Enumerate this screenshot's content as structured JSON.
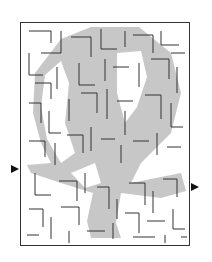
{
  "puzzle": {
    "type": "maze",
    "theme": "hot-air balloon",
    "entry_label": "start",
    "exit_label": "finish"
  },
  "colors": {
    "wall": "#333333",
    "shaded_region": "#b8b8b8",
    "background": "#ffffff",
    "arrow": "#111111"
  },
  "frame": {
    "x": 20,
    "y": 22,
    "width": 170,
    "height": 224
  },
  "entry": {
    "side": "left",
    "y": 169
  },
  "exit": {
    "side": "right",
    "y": 188
  }
}
